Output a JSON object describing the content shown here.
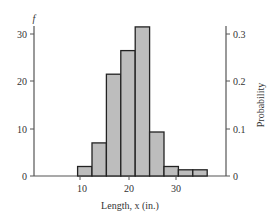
{
  "chart_data": {
    "type": "bar",
    "title": "",
    "xlabel": "Length, x (in.)",
    "ylabel_left": "f",
    "ylabel_right": "Probability",
    "bins": [
      {
        "start": 9.5,
        "end": 12.5,
        "frequency": 2
      },
      {
        "start": 12.5,
        "end": 15.5,
        "frequency": 7
      },
      {
        "start": 15.5,
        "end": 18.5,
        "frequency": 21.5
      },
      {
        "start": 18.5,
        "end": 21.5,
        "frequency": 26.5
      },
      {
        "start": 21.5,
        "end": 24.5,
        "frequency": 31.5
      },
      {
        "start": 24.5,
        "end": 27.5,
        "frequency": 9.3
      },
      {
        "start": 27.5,
        "end": 30.5,
        "frequency": 2
      },
      {
        "start": 30.5,
        "end": 33.5,
        "frequency": 1.3
      },
      {
        "start": 33.5,
        "end": 36.5,
        "frequency": 1.3
      }
    ],
    "categories": [
      "9.5-12.5",
      "12.5-15.5",
      "15.5-18.5",
      "18.5-21.5",
      "21.5-24.5",
      "24.5-27.5",
      "27.5-30.5",
      "30.5-33.5",
      "33.5-36.5"
    ],
    "values": [
      2,
      7,
      21.5,
      26.5,
      31.5,
      9.3,
      2,
      1.3,
      1.3
    ],
    "probabilities": [
      0.02,
      0.07,
      0.215,
      0.265,
      0.315,
      0.093,
      0.02,
      0.013,
      0.013
    ],
    "x_ticks": [
      "10",
      "20",
      "30"
    ],
    "y_left_ticks": [
      "0",
      "10",
      "20",
      "30"
    ],
    "y_right_ticks": [
      "0",
      "0.1",
      "0.2",
      "0.3"
    ],
    "xlim": [
      0,
      40
    ],
    "ylim": [
      0,
      32
    ],
    "ylim_right": [
      0,
      0.32
    ],
    "grid": false,
    "legend": null,
    "bar_color": "#bdbdbd",
    "edge_color": "#222222"
  }
}
